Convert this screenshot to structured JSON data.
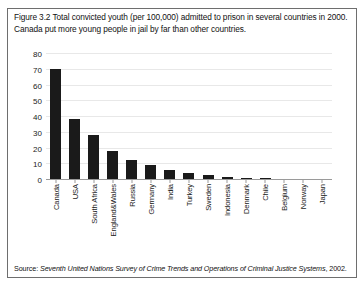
{
  "figure": {
    "caption": "Figure 3.2 Total convicted youth (per 100,000) admitted to prison in several countries in 2000. Canada put more young people in jail by far than other countries.",
    "source_label": "Source: ",
    "source_title": "Seventh United Nations Survey of Crime Trends and Operations of Criminal Justice Systems",
    "source_year": ", 2002."
  },
  "colors": {
    "bar": "#1a1a1a",
    "gridline": "#e8e8e8",
    "axis": "#9a9a9a",
    "frame": "#6e6e6e",
    "text": "#111111",
    "background": "#ffffff"
  },
  "chart_data": {
    "type": "bar",
    "title": "Figure 3.2 Total convicted youth (per 100,000) admitted to prison in several countries in 2000.",
    "subtitle": "Canada put more young people in jail by far than other countries.",
    "xlabel": "",
    "ylabel": "",
    "ylim": [
      0,
      80
    ],
    "yticks": [
      0,
      10,
      20,
      30,
      40,
      50,
      60,
      70,
      80
    ],
    "ytick_labels": [
      "0",
      "10",
      "20",
      "30",
      "40",
      "50",
      "60",
      "70",
      "80"
    ],
    "grid": true,
    "legend": false,
    "categories": [
      "Canada",
      "USA",
      "South Africa",
      "England&Wales",
      "Russia",
      "Germany",
      "India",
      "Turkey",
      "Sweden",
      "Indonesia",
      "Denmark",
      "Chile",
      "Belgium",
      "Norway",
      "Japan"
    ],
    "values": [
      70.5,
      38.5,
      28.5,
      18.5,
      12.5,
      9.5,
      6.5,
      4.5,
      3.0,
      2.0,
      1.5,
      1.0,
      0.3,
      0.2,
      0.1
    ]
  }
}
